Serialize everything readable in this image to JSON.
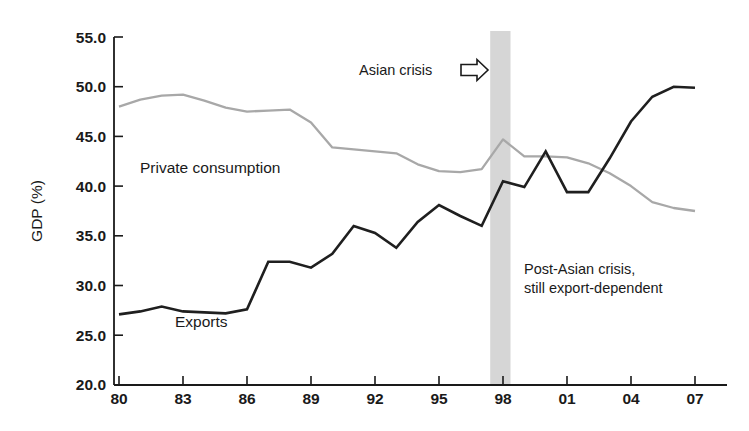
{
  "chart_data": {
    "type": "line",
    "title": "",
    "xlabel": "",
    "ylabel": "GDP (%)",
    "ylim": [
      20.0,
      55.0
    ],
    "xlim": [
      1980,
      2007
    ],
    "grid": false,
    "legend_position": "inline-labels",
    "y_ticks": [
      "20.0",
      "25.0",
      "30.0",
      "35.0",
      "40.0",
      "45.0",
      "50.0",
      "55.0"
    ],
    "y_tick_values": [
      20.0,
      25.0,
      30.0,
      35.0,
      40.0,
      45.0,
      50.0,
      55.0
    ],
    "x_ticks": [
      "80",
      "83",
      "86",
      "89",
      "92",
      "95",
      "98",
      "01",
      "04",
      "07"
    ],
    "x_tick_values": [
      1980,
      1983,
      1986,
      1989,
      1992,
      1995,
      1998,
      2001,
      2004,
      2007
    ],
    "x": [
      1980,
      1981,
      1982,
      1983,
      1984,
      1985,
      1986,
      1987,
      1988,
      1989,
      1990,
      1991,
      1992,
      1993,
      1994,
      1995,
      1996,
      1997,
      1998,
      1999,
      2000,
      2001,
      2002,
      2003,
      2004,
      2005,
      2006,
      2007
    ],
    "series": [
      {
        "name": "Private consumption",
        "color": "#a8a8a8",
        "values": [
          48.0,
          48.7,
          49.1,
          49.2,
          48.6,
          47.9,
          47.5,
          47.6,
          47.7,
          46.4,
          43.9,
          43.7,
          43.5,
          43.3,
          42.2,
          41.5,
          41.4,
          41.7,
          44.7,
          43.0,
          43.0,
          42.9,
          42.3,
          41.3,
          40.0,
          38.4,
          37.8,
          37.5
        ]
      },
      {
        "name": "Exports",
        "color": "#1f1f1f",
        "values": [
          27.1,
          27.4,
          27.9,
          27.4,
          27.3,
          27.2,
          27.6,
          32.4,
          32.4,
          31.8,
          33.2,
          36.0,
          35.3,
          33.8,
          36.4,
          38.1,
          37.0,
          36.0,
          40.5,
          39.9,
          43.5,
          39.4,
          39.4,
          42.8,
          46.5,
          49.0,
          50.0,
          49.9
        ]
      }
    ],
    "annotations": [
      {
        "name": "asian-crisis",
        "text": "Asian crisis",
        "icon": "right-arrow-icon",
        "x_data": 1994.5,
        "y_data": 52.3
      },
      {
        "name": "post-crisis",
        "text_line1": "Post-Asian crisis,",
        "text_line2": "still export-dependent",
        "x_data": 1998.6,
        "y_data": 31.5
      }
    ],
    "shaded_regions": [
      {
        "name": "asian-crisis-band",
        "x_start": 1997.4,
        "x_end": 1998.35,
        "color": "#d6d6d6"
      }
    ],
    "series_inline_labels": [
      {
        "name": "Private consumption",
        "x_data": 1981.7,
        "y_data": 42.3
      },
      {
        "name": "Exports",
        "x_data": 1985.0,
        "y_data": 24.6
      }
    ]
  }
}
